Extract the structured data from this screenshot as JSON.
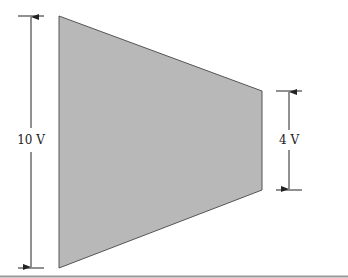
{
  "diagram": {
    "shape": "trapezoid",
    "fill": "#b8b8b8",
    "stroke": "#555555",
    "left_dimension": {
      "label": "10 V"
    },
    "right_dimension": {
      "label": "4 V"
    }
  }
}
